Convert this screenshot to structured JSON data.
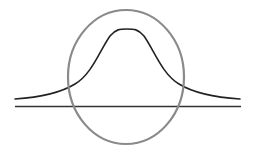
{
  "diagram": {
    "colors": {
      "background": "#ffffff",
      "curve": "#222222",
      "baseline": "#333333",
      "ellipse": "#8a8a8a"
    },
    "elements": {
      "baseline": {
        "x1": 15,
        "y1": 106.5,
        "x2": 241,
        "y2": 106.5,
        "stroke_width": 1.6
      },
      "bell_curve": {
        "path": "M15,99 C45,97 62,92 75,84 C92,74 100,50 110,36 C116,29 120,29 127,29 C134,29 138,29 144,36 C154,50 162,74 179,84 C192,92 209,97 240,99",
        "stroke_width": 1.6
      },
      "ellipse": {
        "cx": 126,
        "cy": 77,
        "rx": 58,
        "ry": 67,
        "stroke_width": 2.2
      }
    }
  }
}
